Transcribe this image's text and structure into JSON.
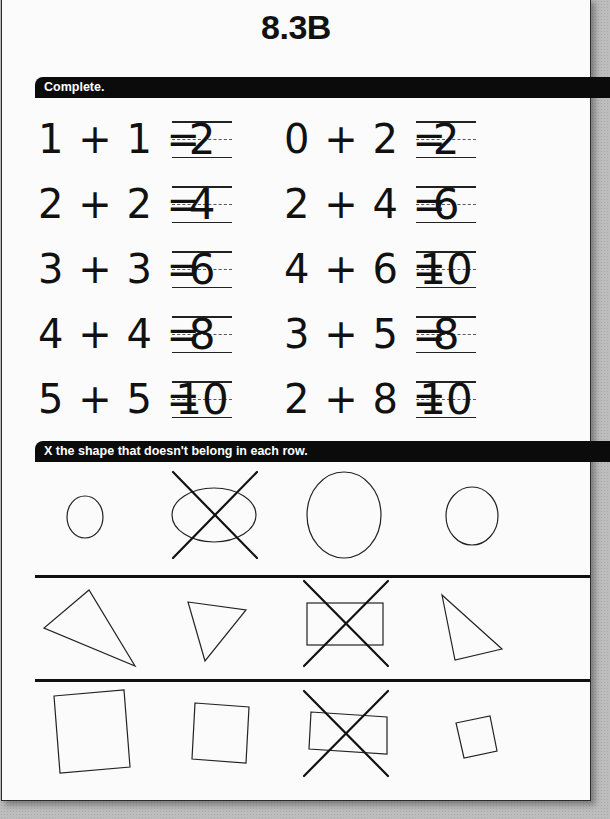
{
  "page": {
    "title": "8.3B",
    "sections": [
      {
        "instruction": "Complete.",
        "equations": [
          {
            "expr": "1 + 1 =",
            "answer": "2"
          },
          {
            "expr": "0 + 2 =",
            "answer": "2"
          },
          {
            "expr": "2 + 2 =",
            "answer": "4"
          },
          {
            "expr": "2 + 4 =",
            "answer": "6"
          },
          {
            "expr": "3 + 3 =",
            "answer": "6"
          },
          {
            "expr": "4 + 6 =",
            "answer": "10"
          },
          {
            "expr": "4 + 4 =",
            "answer": "8"
          },
          {
            "expr": "3 + 5 =",
            "answer": "8"
          },
          {
            "expr": "5 + 5 =",
            "answer": "10"
          },
          {
            "expr": "2 + 8 =",
            "answer": "10"
          }
        ]
      },
      {
        "instruction": "X the shape that doesn't belong in each row.",
        "rows": [
          {
            "shapes": [
              "circle",
              "ellipse",
              "circle",
              "circle"
            ],
            "crossed_index": 1
          },
          {
            "shapes": [
              "triangle",
              "triangle",
              "rectangle",
              "triangle"
            ],
            "crossed_index": 2
          },
          {
            "shapes": [
              "square",
              "square",
              "rectangle",
              "square"
            ],
            "crossed_index": 2
          }
        ]
      }
    ]
  },
  "colors": {
    "ink": "#111111",
    "bar_bg": "#0b0b0b",
    "bar_text": "#ffffff",
    "paper": "#fbfbfb",
    "backdrop": "#bdbdbd"
  }
}
